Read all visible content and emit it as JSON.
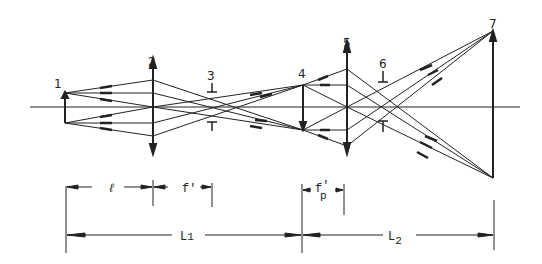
{
  "diagram": {
    "type": "optical-ray-diagram",
    "axis_y": 107,
    "elements": [
      {
        "id": "1",
        "label": "1",
        "kind": "object-arrow"
      },
      {
        "id": "2",
        "label": "2",
        "kind": "lens"
      },
      {
        "id": "3",
        "label": "3",
        "kind": "stop"
      },
      {
        "id": "4",
        "label": "4",
        "kind": "image-arrow"
      },
      {
        "id": "5",
        "label": "5",
        "kind": "lens"
      },
      {
        "id": "6",
        "label": "6",
        "kind": "stop"
      },
      {
        "id": "7",
        "label": "7",
        "kind": "image-arrow"
      }
    ],
    "dimensions": {
      "l": "ℓ",
      "f_prime": "f'",
      "fp_prime_base": "f",
      "fp_prime_sub": "p",
      "fp_prime_mark": "'",
      "L1_base": "L",
      "L1_sub": "1",
      "L2_base": "L",
      "L2_sub": "2"
    }
  }
}
